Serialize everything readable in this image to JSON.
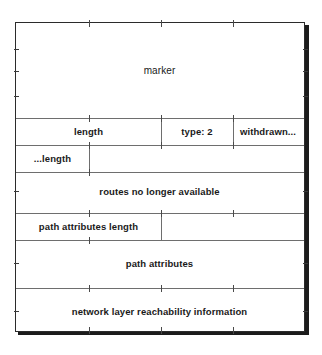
{
  "diagram": {
    "type": "packet-format-diagram",
    "frame_color": "#2b2b2b",
    "line_color": "#6e6e6e",
    "text_color": "#1a1a1a",
    "background": "#ffffff",
    "fields": {
      "marker": "marker",
      "length": "length",
      "type": "type: 2",
      "withdrawn": "withdrawn...",
      "withdrawn_length": "...length",
      "routes_withdrawn": "routes no longer available",
      "path_attributes_length": "path attributes length",
      "path_attributes": "path attributes",
      "nlri": "network layer reachability information"
    }
  }
}
